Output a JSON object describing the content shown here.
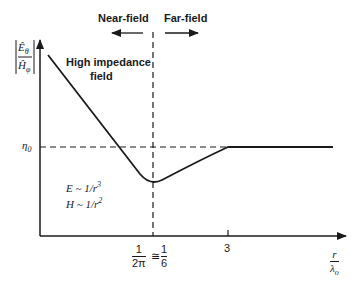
{
  "diagram": {
    "region_labels": {
      "near_field": "Near-field",
      "far_field": "Far-field"
    },
    "y_axis": {
      "label_numerator": "Ê",
      "label_numerator_sub": "θ",
      "label_denominator": "Ĥ",
      "label_denominator_sub": "φ",
      "reference_level": "η",
      "reference_level_sub": "0"
    },
    "x_axis": {
      "label_numerator": "r",
      "label_denominator": "λ",
      "label_denominator_sub": "o",
      "ticks": [
        {
          "num": "1",
          "den": "2π",
          "approx": "≅",
          "num2": "1",
          "den2": "6"
        },
        {
          "label": "3"
        }
      ]
    },
    "annotations": {
      "high_impedance_line1": "High impedance",
      "high_impedance_line2": "field",
      "e_relation": "E ~ 1/r",
      "e_exp": "3",
      "h_relation": "H ~ 1/r",
      "h_exp": "2"
    },
    "colors": {
      "ink": "#1a1a1a",
      "background": "#ffffff"
    }
  }
}
